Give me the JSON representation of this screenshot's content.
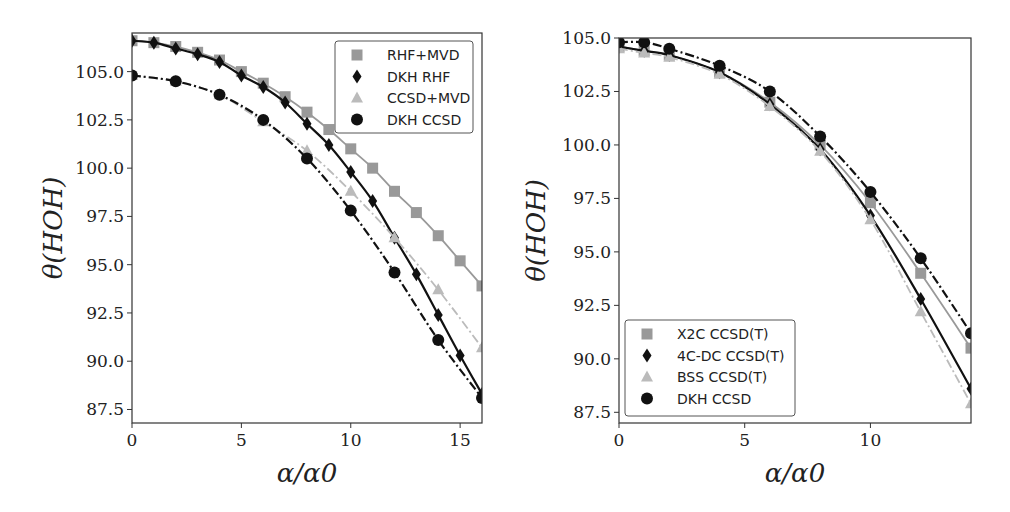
{
  "chart_data": [
    {
      "type": "line",
      "title": "",
      "xlabel": "α/α0",
      "ylabel": "θ(HOH)",
      "xlim": [
        0,
        16
      ],
      "ylim": [
        86.8,
        107.0
      ],
      "xticks": [
        "0",
        "5",
        "10",
        "15"
      ],
      "yticks": [
        "87.5",
        "90.0",
        "92.5",
        "95.0",
        "97.5",
        "100.0",
        "102.5",
        "105.0"
      ],
      "grid": false,
      "legend_position": "upper right",
      "series": [
        {
          "name": "RHF+MVD",
          "marker": "square",
          "line": "solid",
          "color": "#999999",
          "x": [
            0,
            1,
            2,
            3,
            4,
            5,
            6,
            7,
            8,
            9,
            10,
            11,
            12,
            13,
            14,
            15,
            16
          ],
          "y": [
            106.6,
            106.5,
            106.3,
            106.0,
            105.6,
            105.0,
            104.4,
            103.7,
            102.9,
            102.0,
            101.0,
            100.0,
            98.8,
            97.7,
            96.5,
            95.2,
            93.9
          ]
        },
        {
          "name": "DKH RHF",
          "marker": "diamond",
          "line": "solid",
          "color": "#111111",
          "x": [
            0,
            1,
            2,
            3,
            4,
            5,
            6,
            7,
            8,
            9,
            10,
            11,
            12,
            13,
            14,
            15,
            16
          ],
          "y": [
            106.6,
            106.5,
            106.2,
            105.9,
            105.5,
            104.8,
            104.2,
            103.4,
            102.3,
            101.2,
            99.8,
            98.3,
            96.4,
            94.5,
            92.4,
            90.3,
            88.3
          ]
        },
        {
          "name": "CCSD+MVD",
          "marker": "triangle",
          "line": "dashdot",
          "color": "#bbbbbb",
          "x": [
            0,
            2,
            4,
            6,
            8,
            10,
            12,
            14,
            16
          ],
          "y": [
            104.8,
            104.5,
            103.8,
            102.4,
            100.9,
            98.8,
            96.4,
            93.7,
            90.7
          ]
        },
        {
          "name": "DKH CCSD",
          "marker": "circle",
          "line": "dashdot",
          "color": "#111111",
          "x": [
            0,
            2,
            4,
            6,
            8,
            10,
            12,
            14,
            16
          ],
          "y": [
            104.8,
            104.5,
            103.8,
            102.5,
            100.5,
            97.8,
            94.6,
            91.1,
            88.1
          ]
        }
      ]
    },
    {
      "type": "line",
      "title": "",
      "xlabel": "α/α0",
      "ylabel": "θ(HOH)",
      "xlim": [
        0,
        14
      ],
      "ylim": [
        87.0,
        105.0
      ],
      "xticks": [
        "0",
        "5",
        "10"
      ],
      "yticks": [
        "87.5",
        "90.0",
        "92.5",
        "95.0",
        "97.5",
        "100.0",
        "102.5",
        "105.0"
      ],
      "grid": false,
      "legend_position": "lower left",
      "series": [
        {
          "name": "X2C CCSD(T)",
          "marker": "square",
          "line": "solid",
          "color": "#999999",
          "x": [
            0,
            1,
            2,
            4,
            6,
            8,
            10,
            12,
            14
          ],
          "y": [
            104.6,
            104.4,
            104.2,
            103.4,
            102.0,
            100.0,
            97.3,
            94.0,
            90.5
          ]
        },
        {
          "name": "4C-DC CCSD(T)",
          "marker": "diamond",
          "line": "solid",
          "color": "#111111",
          "x": [
            0,
            1,
            2,
            4,
            6,
            8,
            10,
            12,
            14
          ],
          "y": [
            104.6,
            104.4,
            104.2,
            103.4,
            101.9,
            99.8,
            96.7,
            92.8,
            88.6
          ]
        },
        {
          "name": "BSS CCSD(T)",
          "marker": "triangle",
          "line": "dashdot",
          "color": "#bbbbbb",
          "x": [
            0,
            1,
            2,
            4,
            6,
            8,
            10,
            12,
            14
          ],
          "y": [
            104.5,
            104.3,
            104.1,
            103.3,
            101.8,
            99.7,
            96.5,
            92.2,
            87.9
          ]
        },
        {
          "name": "DKH CCSD",
          "marker": "circle",
          "line": "dashdot",
          "color": "#111111",
          "x": [
            0,
            1,
            2,
            4,
            6,
            8,
            10,
            12,
            14
          ],
          "y": [
            104.8,
            104.8,
            104.5,
            103.7,
            102.5,
            100.4,
            97.8,
            94.7,
            91.2
          ]
        }
      ]
    }
  ],
  "panels": [
    {
      "xlabel": "α/α0",
      "ylabel": "θ(HOH)",
      "legend": [
        "RHF+MVD",
        "DKH RHF",
        "CCSD+MVD",
        "DKH CCSD"
      ]
    },
    {
      "xlabel": "α/α0",
      "ylabel": "θ(HOH)",
      "legend": [
        "X2C CCSD(T)",
        "4C-DC CCSD(T)",
        "BSS CCSD(T)",
        "DKH CCSD"
      ]
    }
  ]
}
